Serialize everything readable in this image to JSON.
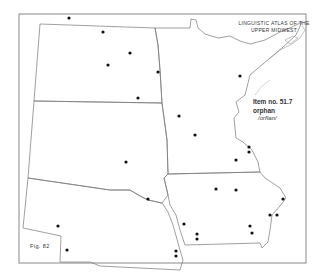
{
  "map": {
    "title_line1": "LINGUISTIC ATLAS OF THE",
    "title_line2": "UPPER MIDWEST",
    "item_label": "Item no. 51.7",
    "word": "orphan",
    "phonetic": "/orfIan/",
    "figure": "Fig. 82",
    "states": [
      "North Dakota",
      "Minnesota",
      "South Dakota",
      "Nebraska",
      "Iowa"
    ],
    "dot_color": "#111111",
    "line_color": "#777777",
    "dots": [
      [
        69,
        18
      ],
      [
        103,
        32
      ],
      [
        130,
        53
      ],
      [
        108,
        65
      ],
      [
        158,
        72
      ],
      [
        138,
        98
      ],
      [
        240,
        76
      ],
      [
        179,
        116
      ],
      [
        195,
        135
      ],
      [
        249,
        147
      ],
      [
        249,
        152
      ],
      [
        236,
        160
      ],
      [
        126,
        162
      ],
      [
        148,
        199
      ],
      [
        216,
        189
      ],
      [
        236,
        190
      ],
      [
        283,
        199
      ],
      [
        270,
        215
      ],
      [
        277,
        215
      ],
      [
        250,
        226
      ],
      [
        252,
        233
      ],
      [
        184,
        224
      ],
      [
        197,
        234
      ],
      [
        197,
        239
      ],
      [
        176,
        251
      ],
      [
        176,
        256
      ],
      [
        58,
        226
      ],
      [
        67,
        250
      ]
    ]
  }
}
